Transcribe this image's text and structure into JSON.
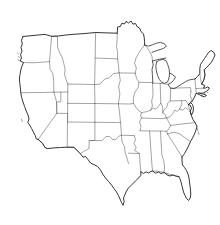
{
  "figure": {
    "kind": "map",
    "subtitle": "",
    "caption": "",
    "projection": "albers-usa-like",
    "width_px": 220,
    "height_px": 225,
    "background_color": "#ffffff",
    "has_labels": false,
    "has_legend": false,
    "has_title_text": false,
    "has_scale_bar": false,
    "has_graticule": false,
    "has_fill": false
  },
  "style": {
    "national_outline_color": "#2a2a2a",
    "state_boundary_color": "#6b6b6b",
    "lake_outline_color": "#3a3a3a",
    "island_outline_color": "#555555",
    "land_fill": "none"
  },
  "extent": {
    "left_px": 10,
    "top_px": 18,
    "right_px": 216,
    "bottom_px": 206
  },
  "regions": [
    {
      "name": "pacific-northwest",
      "states": [
        "Washington",
        "Oregon",
        "Idaho"
      ]
    },
    {
      "name": "northern-rockies-plains",
      "states": [
        "Montana",
        "Wyoming",
        "North Dakota",
        "South Dakota",
        "Nebraska"
      ]
    },
    {
      "name": "southwest",
      "states": [
        "California",
        "Nevada",
        "Utah",
        "Arizona",
        "New Mexico",
        "Colorado"
      ]
    },
    {
      "name": "south-central",
      "states": [
        "Texas",
        "Oklahoma",
        "Kansas",
        "Arkansas",
        "Louisiana"
      ]
    },
    {
      "name": "upper-midwest",
      "states": [
        "Minnesota",
        "Wisconsin",
        "Iowa",
        "Missouri",
        "Michigan",
        "Illinois",
        "Indiana",
        "Ohio"
      ]
    },
    {
      "name": "southeast",
      "states": [
        "Kentucky",
        "Tennessee",
        "Mississippi",
        "Alabama",
        "Georgia",
        "Florida",
        "South Carolina",
        "North Carolina",
        "Virginia",
        "West Virginia"
      ]
    },
    {
      "name": "mid-atlantic",
      "states": [
        "Pennsylvania",
        "New York",
        "New Jersey",
        "Delaware",
        "Maryland"
      ]
    },
    {
      "name": "new-england",
      "states": [
        "Maine",
        "New Hampshire",
        "Vermont",
        "Massachusetts",
        "Rhode Island",
        "Connecticut"
      ]
    }
  ],
  "features": {
    "great_lakes": [
      "Lake Superior",
      "Lake Michigan",
      "Lake Huron",
      "Lake Erie",
      "Lake Ontario"
    ],
    "peninsulas": [
      "Florida",
      "Michigan Upper Peninsula",
      "Michigan Lower Peninsula",
      "Cape Cod",
      "Delmarva"
    ],
    "bays": [
      "Chesapeake Bay",
      "Puget Sound",
      "San Francisco Bay",
      "Galveston Bay"
    ],
    "state_count": 48
  }
}
